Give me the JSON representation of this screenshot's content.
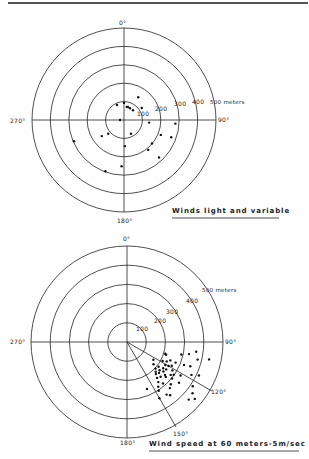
{
  "chart_data": [
    {
      "type": "scatter",
      "coordinate_system": "polar",
      "title": "Winds light and variable",
      "angular_labels": [
        "0°",
        "90°",
        "180°",
        "270°"
      ],
      "radial_rings_m": [
        100,
        200,
        300,
        400,
        500
      ],
      "radial_labels": [
        "100",
        "200",
        "300",
        "400",
        "500 meters"
      ],
      "rlim": [
        0,
        500
      ],
      "grid": true,
      "points": [
        {
          "bearing": 335,
          "distance": 90
        },
        {
          "bearing": 0,
          "distance": 93
        },
        {
          "bearing": 12,
          "distance": 73
        },
        {
          "bearing": 17,
          "distance": 74
        },
        {
          "bearing": 27,
          "distance": 72
        },
        {
          "bearing": 43,
          "distance": 72
        },
        {
          "bearing": 32,
          "distance": 146
        },
        {
          "bearing": 56,
          "distance": 117
        },
        {
          "bearing": 270,
          "distance": 22
        },
        {
          "bearing": 96,
          "distance": 137
        },
        {
          "bearing": 94,
          "distance": 280
        },
        {
          "bearing": 112,
          "distance": 216
        },
        {
          "bearing": 110,
          "distance": 273
        },
        {
          "bearing": 234,
          "distance": 149
        },
        {
          "bearing": 229,
          "distance": 114
        },
        {
          "bearing": 153,
          "distance": 84
        },
        {
          "bearing": 247,
          "distance": 295
        },
        {
          "bearing": 178,
          "distance": 142
        },
        {
          "bearing": 130,
          "distance": 199
        },
        {
          "bearing": 141,
          "distance": 209
        },
        {
          "bearing": 137,
          "distance": 279
        },
        {
          "bearing": 183,
          "distance": 252
        },
        {
          "bearing": 200,
          "distance": 296
        }
      ]
    },
    {
      "type": "scatter",
      "coordinate_system": "polar",
      "title": "Wind speed at 60 meters-5m/sec",
      "angular_labels": [
        "0°",
        "90°",
        "120°",
        "150°",
        "180°",
        "270°"
      ],
      "radial_rings_m": [
        100,
        200,
        300,
        400,
        500
      ],
      "radial_labels": [
        "100",
        "200",
        "300",
        "400",
        "500 meters"
      ],
      "rlim": [
        0,
        500
      ],
      "grid": true,
      "sector_lines_deg": [
        120,
        150
      ],
      "points": [
        {
          "bearing": 124,
          "distance": 166
        },
        {
          "bearing": 118,
          "distance": 210
        },
        {
          "bearing": 130,
          "distance": 180
        },
        {
          "bearing": 133,
          "distance": 203
        },
        {
          "bearing": 136,
          "distance": 215
        },
        {
          "bearing": 128,
          "distance": 209
        },
        {
          "bearing": 131,
          "distance": 225
        },
        {
          "bearing": 134,
          "distance": 232
        },
        {
          "bearing": 138,
          "distance": 225
        },
        {
          "bearing": 126,
          "distance": 233
        },
        {
          "bearing": 140,
          "distance": 244
        },
        {
          "bearing": 129,
          "distance": 244
        },
        {
          "bearing": 136,
          "distance": 252
        },
        {
          "bearing": 142,
          "distance": 265
        },
        {
          "bearing": 131,
          "distance": 262
        },
        {
          "bearing": 145,
          "distance": 284
        },
        {
          "bearing": 139,
          "distance": 286
        },
        {
          "bearing": 147,
          "distance": 303
        },
        {
          "bearing": 107,
          "distance": 208
        },
        {
          "bearing": 108,
          "distance": 214
        },
        {
          "bearing": 103,
          "distance": 290
        },
        {
          "bearing": 113,
          "distance": 275
        },
        {
          "bearing": 118,
          "distance": 264
        },
        {
          "bearing": 122,
          "distance": 279
        },
        {
          "bearing": 125,
          "distance": 297
        },
        {
          "bearing": 129,
          "distance": 302
        },
        {
          "bearing": 134,
          "distance": 317
        },
        {
          "bearing": 137,
          "distance": 328
        },
        {
          "bearing": 143,
          "distance": 343
        },
        {
          "bearing": 122,
          "distance": 329
        },
        {
          "bearing": 128,
          "distance": 344
        },
        {
          "bearing": 101,
          "distance": 329
        },
        {
          "bearing": 98,
          "distance": 364
        },
        {
          "bearing": 104,
          "distance": 379
        },
        {
          "bearing": 111,
          "distance": 353
        },
        {
          "bearing": 117,
          "distance": 377
        },
        {
          "bearing": 115,
          "distance": 413
        },
        {
          "bearing": 102,
          "distance": 437
        },
        {
          "bearing": 124,
          "distance": 413
        },
        {
          "bearing": 128,
          "distance": 433
        },
        {
          "bearing": 133,
          "distance": 440
        },
        {
          "bearing": 130,
          "distance": 461
        },
        {
          "bearing": 157,
          "distance": 266
        },
        {
          "bearing": 150,
          "distance": 338
        },
        {
          "bearing": 121,
          "distance": 233
        },
        {
          "bearing": 125,
          "distance": 249
        },
        {
          "bearing": 120,
          "distance": 250
        },
        {
          "bearing": 132,
          "distance": 272
        },
        {
          "bearing": 116,
          "distance": 230
        },
        {
          "bearing": 113,
          "distance": 245
        },
        {
          "bearing": 127,
          "distance": 285
        },
        {
          "bearing": 112,
          "distance": 320
        },
        {
          "bearing": 141,
          "distance": 357
        }
      ]
    }
  ],
  "chart1": {
    "title": "Winds light and variable",
    "labels": {
      "n": "0°",
      "e": "90°",
      "s": "180°",
      "w": "270°"
    },
    "rings": {
      "r100": "100",
      "r200": "200",
      "r300": "300",
      "r400": "400",
      "r500": "500 meters"
    }
  },
  "chart2": {
    "title": "Wind speed at 60 meters-5m/sec",
    "labels": {
      "n": "0°",
      "e": "90°",
      "s": "180°",
      "w": "270°",
      "a120": "120°",
      "a150": "150°"
    },
    "rings": {
      "r100": "100",
      "r200": "200",
      "r300": "300",
      "r400": "400",
      "r500": "500 meters"
    }
  }
}
